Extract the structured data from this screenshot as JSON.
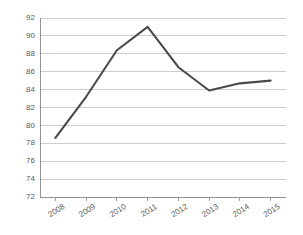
{
  "chart_data": {
    "type": "line",
    "title": "",
    "subtitle": "",
    "xlabel": "",
    "ylabel": "",
    "categories": [
      "2008",
      "2009",
      "2010",
      "2011",
      "2012",
      "2013",
      "2014",
      "2015"
    ],
    "values": [
      78.6,
      83.2,
      88.4,
      91.0,
      86.5,
      83.9,
      84.7,
      85.0
    ],
    "series": [
      {
        "name": "",
        "values": [
          78.6,
          83.2,
          88.4,
          91.0,
          86.5,
          83.9,
          84.7,
          85.0
        ]
      }
    ],
    "ylim": [
      72,
      92
    ],
    "ytick_values": [
      72,
      74,
      76,
      78,
      80,
      82,
      84,
      86,
      88,
      90,
      92
    ],
    "ytick_labels": [
      "72",
      "74",
      "76",
      "78",
      "80",
      "82",
      "84",
      "86",
      "88",
      "90",
      "92"
    ],
    "xtick_labels": [
      "2008",
      "2009",
      "2010",
      "2011",
      "2012",
      "2013",
      "2014",
      "2015"
    ],
    "xtick_label_rotation": -32,
    "grid": true,
    "grid_axis": "y",
    "legend": false,
    "legend_position": "none",
    "annotations": [],
    "colors": {
      "line": "#4a4a4a",
      "gridline": "#b8b8b8",
      "axis": "#8a8a8a",
      "tick_label": "#5a5a5a",
      "background": "#ffffff"
    }
  },
  "axes": {
    "plot_left": 40,
    "plot_right": 286,
    "plot_top": 18,
    "plot_bottom": 197
  }
}
